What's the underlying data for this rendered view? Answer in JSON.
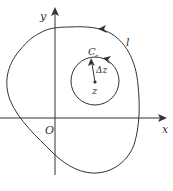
{
  "diagram": {
    "type": "complex-plane contour diagram",
    "axes": {
      "x_label": "x",
      "y_label": "y",
      "origin_label": "O"
    },
    "outer_contour": {
      "label": "l",
      "orientation": "counterclockwise"
    },
    "inner_circle": {
      "label_main": "C",
      "label_sub": "r",
      "center_label": "z",
      "radius_label": "Δz",
      "orientation": "counterclockwise"
    },
    "colors": {
      "stroke": "#333333",
      "background": "#ffffff"
    }
  }
}
